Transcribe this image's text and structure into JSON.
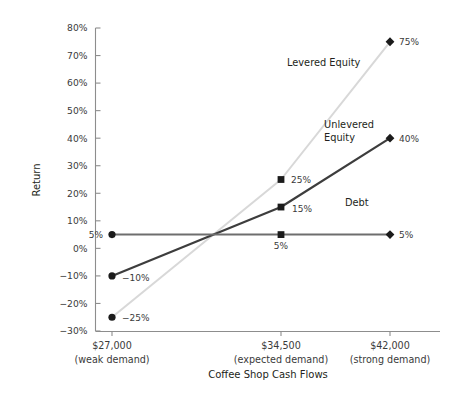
{
  "chart_data": {
    "type": "line",
    "title": "",
    "xlabel": "Coffee Shop Cash Flows",
    "ylabel": "Return",
    "categories": [
      "$27,000",
      "$34,500",
      "$42,000"
    ],
    "category_sublabels": [
      "(weak demand)",
      "(expected demand)",
      "(strong demand)"
    ],
    "x_values": [
      27000,
      34500,
      42000
    ],
    "ylim": [
      -30,
      80
    ],
    "ytick_values": [
      80,
      70,
      60,
      50,
      40,
      30,
      20,
      10,
      0,
      -10,
      -20,
      -30
    ],
    "ytick_labels": [
      "80%",
      "70%",
      "60%",
      "50%",
      "40%",
      "30%",
      "20%",
      "10%",
      "0%",
      "−10%",
      "−20%",
      "−30%"
    ],
    "grid": false,
    "legend_position": "inline-annotations",
    "series": [
      {
        "name": "Levered Equity",
        "values": [
          -25,
          25,
          75
        ],
        "point_labels": [
          "−25%",
          "25%",
          "75%"
        ],
        "color": "#d8d8d8",
        "width": 2.0,
        "markers": [
          "circle",
          "square",
          "diamond"
        ],
        "label_x": 287,
        "label_y": 66
      },
      {
        "name": "Unlevered Equity",
        "name_line1": "Unlevered",
        "name_line2": "Equity",
        "values": [
          -10,
          15,
          40
        ],
        "point_labels": [
          "−10%",
          "15%",
          "40%"
        ],
        "color": "#3d3d3d",
        "width": 2.2,
        "markers": [
          "circle",
          "square",
          "diamond"
        ],
        "label_x": 324,
        "label_y": 128
      },
      {
        "name": "Debt",
        "values": [
          5,
          5,
          5
        ],
        "point_labels": [
          "5%",
          "5%",
          "5%"
        ],
        "color": "#6e6e6e",
        "width": 2.0,
        "markers": [
          "circle",
          "square",
          "diamond"
        ],
        "label_x": 345,
        "label_y": 206
      }
    ]
  }
}
